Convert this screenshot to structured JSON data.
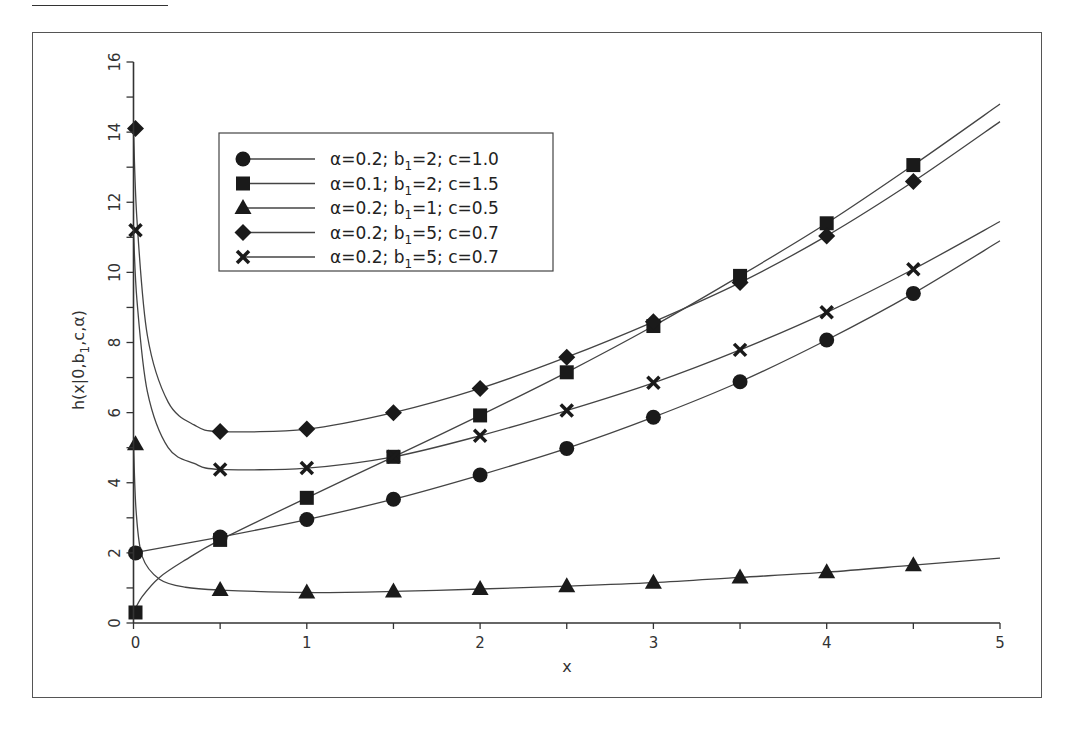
{
  "chart_data": {
    "type": "line",
    "title": "",
    "xlabel": "x",
    "ylabel": "h(x|0,b₁,c,α)",
    "xlim": [
      0,
      5
    ],
    "ylim": [
      0,
      16
    ],
    "x_ticks": [
      "0",
      "1",
      "2",
      "3",
      "4",
      "5"
    ],
    "y_ticks": [
      "0",
      "2",
      "4",
      "6",
      "8",
      "10",
      "12",
      "14",
      "16"
    ],
    "grid": false,
    "legend_position": "upper-left-inside",
    "marker_x": [
      0,
      0.5,
      1,
      1.5,
      2,
      2.5,
      3,
      3.5,
      4,
      4.5
    ],
    "series": [
      {
        "name": "α=0.2; b₁=2; c=1.0",
        "marker": "circle",
        "values": [
          2.0,
          2.45,
          2.95,
          3.53,
          4.22,
          4.98,
          5.87,
          6.88,
          8.07,
          9.4
        ],
        "end_value_x5": 10.9
      },
      {
        "name": "α=0.1; b₁=2; c=1.5",
        "marker": "square",
        "values": [
          0.3,
          2.37,
          3.57,
          4.74,
          5.92,
          7.15,
          8.47,
          9.9,
          11.4,
          13.06
        ],
        "end_value_x5": 14.8
      },
      {
        "name": "α=0.2; b₁=1; c=0.5",
        "marker": "triangle",
        "values": [
          5.1,
          0.94,
          0.87,
          0.9,
          0.97,
          1.05,
          1.15,
          1.3,
          1.45,
          1.65
        ],
        "end_value_x5": 1.85
      },
      {
        "name": "α=0.2; b₁=5; c=0.7",
        "marker": "diamond",
        "values": [
          14.1,
          5.46,
          5.53,
          6.0,
          6.69,
          7.58,
          8.59,
          9.71,
          11.04,
          12.59
        ],
        "end_value_x5": 14.3
      },
      {
        "name": "α=0.2; b₁=5; c=0.7",
        "marker": "cross",
        "values": [
          11.2,
          4.38,
          4.42,
          4.74,
          5.34,
          6.06,
          6.85,
          7.79,
          8.86,
          10.09
        ],
        "end_value_x5": 11.45
      }
    ]
  },
  "legend": {
    "items": [
      {
        "alpha": "α=0.2;",
        "b_pre": "b",
        "b_sub": "1",
        "b_post": "=2;",
        "c": "c=1.0"
      },
      {
        "alpha": "α=0.1;",
        "b_pre": "b",
        "b_sub": "1",
        "b_post": "=2;",
        "c": "c=1.5"
      },
      {
        "alpha": "α=0.2;",
        "b_pre": "b",
        "b_sub": "1",
        "b_post": "=1;",
        "c": "c=0.5"
      },
      {
        "alpha": "α=0.2;",
        "b_pre": "b",
        "b_sub": "1",
        "b_post": "=5;",
        "c": "c=0.7"
      },
      {
        "alpha": "α=0.2;",
        "b_pre": "b",
        "b_sub": "1",
        "b_post": "=5;",
        "c": "c=0.7"
      }
    ]
  },
  "axes": {
    "xlabel": "x",
    "ylabel_pre": "h(x|0,b",
    "ylabel_sub": "1",
    "ylabel_post": ",c,α)"
  },
  "colors": {
    "line": "#444444",
    "marker": "#1a1a1a",
    "axis": "#333333",
    "frame": "#555555"
  }
}
